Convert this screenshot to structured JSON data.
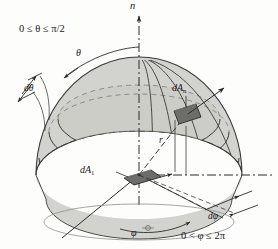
{
  "figure": {
    "name": "hemisphere-solid-angle-diagram",
    "type": "3d geometric diagram",
    "background_color": "#fdfdfc",
    "surface_fill": "#d2d2ce",
    "surface_fill_dark": "#c2c2bd",
    "patch_fill": "#6f6f6c",
    "line_color": "#3a3a38"
  },
  "labels": {
    "axis_n": "n",
    "theta_range": "0 ≤ θ ≤ π/2",
    "phi_range": "0 < φ ≤ 2π",
    "theta": "θ",
    "d_theta": "dθ",
    "phi": "φ",
    "d_phi": "dφ",
    "radius": "r",
    "dA_n_main": "dA",
    "dA_n_sub": "n",
    "dA_1_main": "dA",
    "dA_1_sub": "1"
  },
  "geometry": {
    "center": {
      "x": 139,
      "y": 175
    },
    "sphere_radius_x": 103,
    "sphere_radius_y": 44,
    "sphere_height": 118,
    "axis_top": {
      "x": 139,
      "y": 8
    },
    "horizontal_axis_right_end": {
      "x": 272,
      "y": 175
    },
    "dA_n_patch": {
      "x": 186,
      "y": 112
    },
    "dA_1_patch": {
      "x": 139,
      "y": 176
    }
  }
}
